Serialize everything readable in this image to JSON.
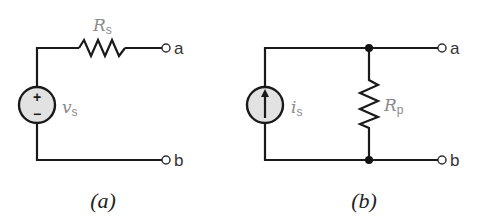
{
  "diagram": {
    "type": "circuit-schematic",
    "subfigures": [
      {
        "id": "a",
        "caption": "(a)",
        "source": {
          "type": "voltage-source",
          "symbol": "v",
          "subscript": "s",
          "polarity_top": "+",
          "polarity_bottom": "−"
        },
        "resistor": {
          "symbol": "R",
          "subscript": "s",
          "connection": "series"
        },
        "terminals": [
          "a",
          "b"
        ]
      },
      {
        "id": "b",
        "caption": "(b)",
        "source": {
          "type": "current-source",
          "symbol": "i",
          "subscript": "s",
          "direction": "up"
        },
        "resistor": {
          "symbol": "R",
          "subscript": "p",
          "connection": "parallel"
        },
        "terminals": [
          "a",
          "b"
        ]
      }
    ],
    "colors": {
      "wire": "#1a1a1a",
      "source_fill": "#e2e2e2",
      "label_gray": "#8a8a8a",
      "background": "#ffffff"
    }
  }
}
